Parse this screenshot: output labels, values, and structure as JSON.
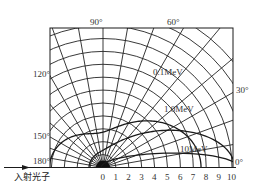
{
  "diagram": {
    "incident_label": "入射光子",
    "angle_labels": [
      {
        "text": "90°",
        "angle": 90
      },
      {
        "text": "60°",
        "angle": 60
      },
      {
        "text": "120°",
        "angle": 120
      },
      {
        "text": "30°",
        "angle": 30
      },
      {
        "text": "150°",
        "angle": 150
      },
      {
        "text": "180°",
        "angle": 180
      },
      {
        "text": "0°",
        "angle": 0
      }
    ],
    "radial_ticks": [
      "0",
      "1",
      "2",
      "3",
      "4",
      "5",
      "6",
      "7",
      "8",
      "9",
      "10"
    ],
    "curves": [
      {
        "label": "0.1MeV",
        "energy_mev": 0.1
      },
      {
        "label": "1.0MeV",
        "energy_mev": 1.0
      },
      {
        "label": "10MeV",
        "energy_mev": 10
      }
    ],
    "colors": {
      "line": "#1a1a1a",
      "grid": "#222222",
      "text": "#333333"
    }
  }
}
